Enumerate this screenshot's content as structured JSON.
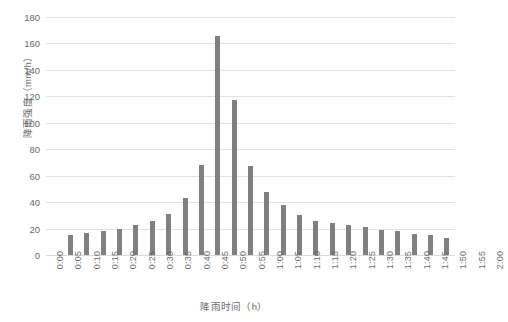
{
  "chart_data": {
    "type": "bar",
    "title": "",
    "xlabel": "降雨时间（h）",
    "ylabel": "降雨强度（mm/h）",
    "ylim": [
      0,
      180
    ],
    "yticks": [
      0,
      20,
      40,
      60,
      80,
      100,
      120,
      140,
      160,
      180
    ],
    "grid": true,
    "legend": "none",
    "bar_color": "#808080",
    "gridline_color": "#e2e2e2",
    "axis_text_color": "#6b6b6b",
    "categories": [
      "0:00",
      "0:05",
      "0:10",
      "0:15",
      "0:20",
      "0:25",
      "0:30",
      "0:35",
      "0:40",
      "0:45",
      "0:50",
      "0:55",
      "1:00",
      "1:05",
      "1:10",
      "1:15",
      "1:20",
      "1:25",
      "1:30",
      "1:35",
      "1:40",
      "1:45",
      "1:50",
      "1:55",
      "2:00"
    ],
    "values": [
      0,
      15,
      17,
      18,
      20,
      23,
      26,
      31,
      43,
      68,
      166,
      117,
      67,
      48,
      38,
      30,
      26,
      24,
      23,
      21,
      19,
      18,
      16,
      15,
      13
    ]
  }
}
